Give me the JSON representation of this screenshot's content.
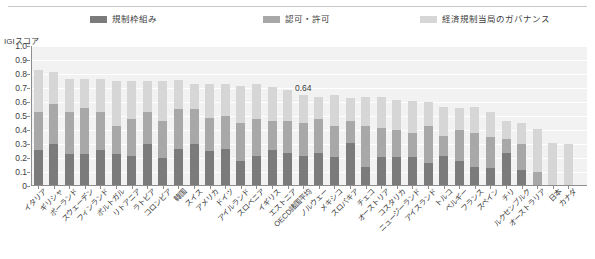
{
  "chart_data": {
    "type": "bar",
    "subtype": "stacked-bar",
    "title": "",
    "xlabel": "",
    "ylabel": "IGIスコア",
    "ylim": [
      0,
      1.0
    ],
    "ytick_labels": [
      "1.0",
      "0.9",
      "0.8",
      "0.7",
      "0.6",
      "0.5",
      "0.4",
      "0.3",
      "0.2",
      "0.1",
      "0"
    ],
    "ytick_values": [
      1.0,
      0.9,
      0.8,
      0.7,
      0.6,
      0.5,
      0.4,
      0.3,
      0.2,
      0.1,
      0
    ],
    "grid": true,
    "legend_position": "top",
    "categories": [
      "イタリア",
      "ギリシャ",
      "ポーランド",
      "スウェーデン",
      "フィンランド",
      "ポルトガル",
      "リトアニア",
      "ラトビア",
      "コロンビア",
      "韓国",
      "スイス",
      "アメリカ",
      "ドイツ",
      "アイルランド",
      "スロベニア",
      "イギリス",
      "エストニア",
      "OECD諸国平均",
      "ノルウェー",
      "メキシコ",
      "スロバキア",
      "チェコ",
      "オーストリア",
      "コスタリカ",
      "ニュージーランド",
      "アイスランド",
      "トルコ",
      "ベルギー",
      "フランス",
      "スペイン",
      "チリ",
      "ルクセンブルク",
      "オーストラリア",
      "日本",
      "カナダ"
    ],
    "series": [
      {
        "name": "規制枠組み",
        "color": "#7b7b7b",
        "values": [
          0.25,
          0.29,
          0.22,
          0.22,
          0.25,
          0.22,
          0.21,
          0.29,
          0.19,
          0.26,
          0.29,
          0.24,
          0.26,
          0.17,
          0.21,
          0.25,
          0.23,
          0.21,
          0.23,
          0.2,
          0.3,
          0.13,
          0.2,
          0.2,
          0.2,
          0.16,
          0.21,
          0.17,
          0.13,
          0.12,
          0.23,
          0.11,
          0.0,
          0.0,
          0.0
        ]
      },
      {
        "name": "認可・許可",
        "color": "#a8a8a8",
        "values": [
          0.27,
          0.29,
          0.3,
          0.33,
          0.27,
          0.2,
          0.26,
          0.23,
          0.27,
          0.28,
          0.25,
          0.24,
          0.23,
          0.27,
          0.26,
          0.21,
          0.23,
          0.23,
          0.24,
          0.22,
          0.16,
          0.29,
          0.21,
          0.19,
          0.17,
          0.26,
          0.14,
          0.22,
          0.24,
          0.22,
          0.1,
          0.18,
          0.09,
          0.0,
          0.0
        ]
      },
      {
        "name": "経済規制当局のガバナンス",
        "color": "#d6d6d6",
        "values": [
          0.3,
          0.23,
          0.24,
          0.21,
          0.24,
          0.32,
          0.27,
          0.22,
          0.28,
          0.21,
          0.18,
          0.24,
          0.23,
          0.27,
          0.25,
          0.24,
          0.22,
          0.2,
          0.16,
          0.22,
          0.16,
          0.21,
          0.22,
          0.22,
          0.23,
          0.17,
          0.21,
          0.16,
          0.19,
          0.18,
          0.13,
          0.15,
          0.31,
          0.3,
          0.29
        ]
      }
    ],
    "totals": [
      0.82,
      0.81,
      0.76,
      0.76,
      0.76,
      0.74,
      0.74,
      0.74,
      0.74,
      0.75,
      0.72,
      0.72,
      0.72,
      0.71,
      0.72,
      0.7,
      0.68,
      0.64,
      0.63,
      0.64,
      0.62,
      0.63,
      0.63,
      0.61,
      0.6,
      0.59,
      0.56,
      0.55,
      0.56,
      0.52,
      0.46,
      0.44,
      0.4,
      0.3,
      0.29
    ],
    "annotations": [
      {
        "text": "0.64",
        "category": "OECD諸国平均",
        "index": 17,
        "value": 0.64
      }
    ]
  },
  "legend": {
    "items": [
      {
        "label": "規制枠組み",
        "color": "#7b7b7b"
      },
      {
        "label": "認可・許可",
        "color": "#a8a8a8"
      },
      {
        "label": "経済規制当局のガバナンス",
        "color": "#d6d6d6"
      }
    ]
  },
  "axis": {
    "y_title": "IGIスコア"
  }
}
